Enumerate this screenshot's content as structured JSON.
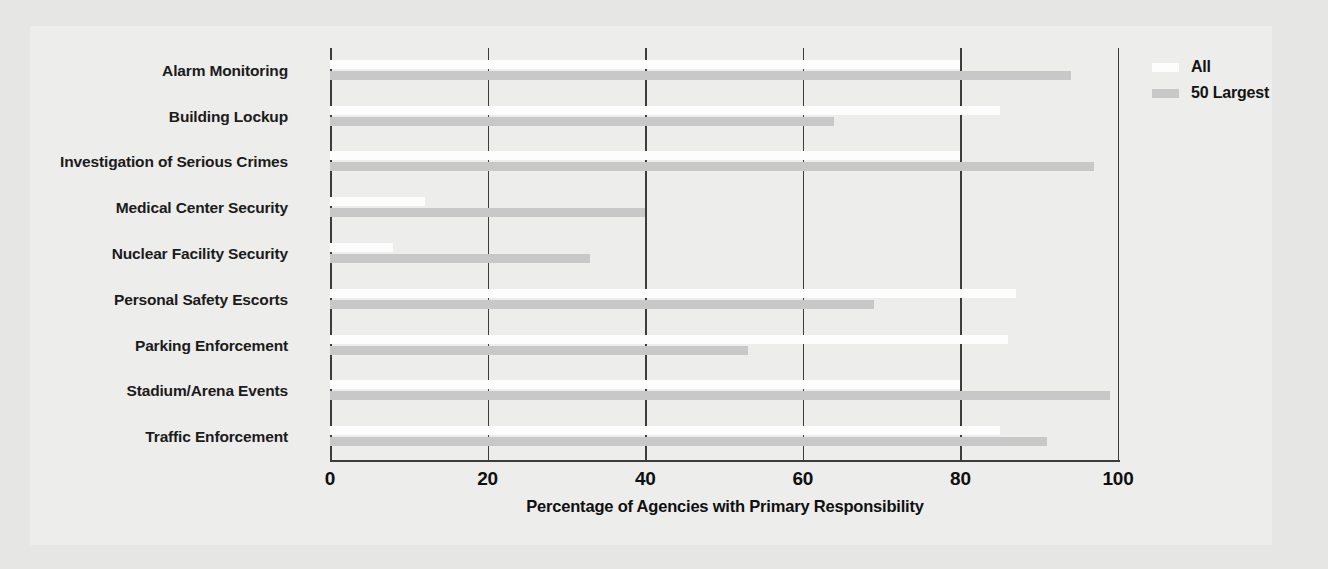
{
  "chart_data": {
    "type": "bar",
    "orientation": "horizontal",
    "title": "",
    "subtitle": "",
    "xlabel": "Percentage of Agencies with Primary Responsibility",
    "ylabel": "",
    "xlim": [
      0,
      105
    ],
    "xticks": [
      0,
      20,
      40,
      60,
      80,
      100
    ],
    "xtick_labels": [
      "0",
      "20",
      "40",
      "60",
      "80",
      "100"
    ],
    "grid": "vertical-only",
    "legend_position": "top-right",
    "categories": [
      "Alarm Monitoring",
      "Building Lockup",
      "Investigation of Serious Crimes",
      "Medical Center Security",
      "Nuclear Facility Security",
      "Personal Safety Escorts",
      "Parking Enforcement",
      "Stadium/Arena Events",
      "Traffic Enforcement"
    ],
    "series": [
      {
        "name": "All",
        "color": "#fdfdfd",
        "values": [
          80,
          85,
          80,
          12,
          8,
          87,
          86,
          80,
          85
        ]
      },
      {
        "name": "50 Largest",
        "color": "#c8c8c8",
        "values": [
          94,
          64,
          97,
          40,
          33,
          69,
          53,
          99,
          91
        ]
      }
    ]
  },
  "legend": {
    "items": [
      {
        "label": "All",
        "color": "#fdfdfd"
      },
      {
        "label": "50 Largest",
        "color": "#c8c8c8"
      }
    ]
  },
  "axis": {
    "x_title": "Percentage of Agencies with Primary Responsibility"
  },
  "colors": {
    "background": "#e6e6e4",
    "plate": "#ededeb",
    "axis": "#3c3c3c",
    "text": "#101010",
    "series_all": "#fdfdfd",
    "series_50_largest": "#c8c8c8"
  }
}
